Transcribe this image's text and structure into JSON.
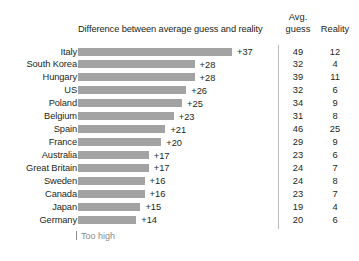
{
  "chart_data": {
    "type": "bar",
    "title": "Difference between average guess and reality",
    "xlabel": "",
    "ylabel": "",
    "orientation": "horizontal",
    "grid": false,
    "legend": null,
    "annotation": "Too high",
    "columns": {
      "avg_line1": "Avg.",
      "avg_line2": "guess",
      "reality": "Reality"
    },
    "categories": [
      "Italy",
      "South Korea",
      "Hungary",
      "US",
      "Poland",
      "Belgium",
      "Spain",
      "France",
      "Australia",
      "Great Britain",
      "Sweden",
      "Canada",
      "Japan",
      "Germany"
    ],
    "values": [
      37,
      28,
      28,
      26,
      25,
      23,
      21,
      20,
      17,
      17,
      16,
      16,
      15,
      14
    ],
    "value_labels": [
      "+37",
      "+28",
      "+28",
      "+26",
      "+25",
      "+23",
      "+21",
      "+20",
      "+17",
      "+17",
      "+16",
      "+16",
      "+15",
      "+14"
    ],
    "series": [
      {
        "name": "Avg. guess",
        "values": [
          49,
          32,
          39,
          32,
          34,
          31,
          46,
          29,
          23,
          24,
          24,
          23,
          19,
          20
        ]
      },
      {
        "name": "Reality",
        "values": [
          12,
          4,
          11,
          6,
          9,
          8,
          25,
          9,
          6,
          7,
          8,
          7,
          4,
          6
        ]
      }
    ],
    "xlim": [
      0,
      37
    ],
    "bar_color": "#a3a3a3"
  }
}
